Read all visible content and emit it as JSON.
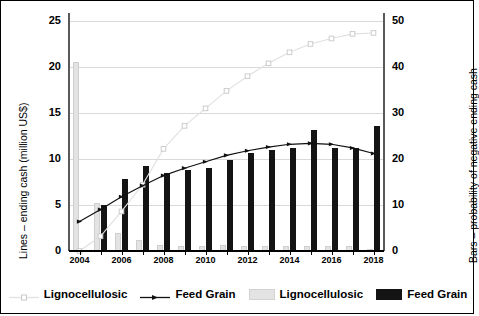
{
  "axes": {
    "left_title": "Lines – ending cash (million US$)",
    "right_title": "Bars – probability of negative ending cash",
    "left_ticks": [
      "0",
      "5",
      "10",
      "15",
      "20",
      "25"
    ],
    "right_ticks": [
      "0",
      "10",
      "20",
      "30",
      "40",
      "50"
    ],
    "x_ticks": [
      "2004",
      "2006",
      "2008",
      "2010",
      "2012",
      "2014",
      "2016",
      "2018"
    ]
  },
  "legend": {
    "items": [
      {
        "label": "Lignocellulosic",
        "kind": "line",
        "color": "#e0e0e0"
      },
      {
        "label": "Feed Grain",
        "kind": "line",
        "color": "#111111"
      },
      {
        "label": "Lignocellulosic",
        "kind": "bar",
        "color": "#e3e3e3"
      },
      {
        "label": "Feed Grain",
        "kind": "bar",
        "color": "#141414"
      }
    ]
  },
  "colors": {
    "lignocellulosic": "#e3e3e3",
    "feed_grain": "#141414",
    "grid": "#d9d9d9",
    "axis": "#595959"
  },
  "chart_data": {
    "type": "bar",
    "title": "",
    "xlabel": "",
    "ylabel": "Lines – ending cash (million US$)",
    "y2label": "Bars – probability of negative ending cash",
    "ylim": [
      0,
      25
    ],
    "y2lim": [
      0,
      50
    ],
    "grid": true,
    "legend_position": "bottom",
    "categories": [
      2004,
      2005,
      2006,
      2007,
      2008,
      2009,
      2010,
      2011,
      2012,
      2013,
      2014,
      2015,
      2016,
      2017,
      2018
    ],
    "series": [
      {
        "name": "Lignocellulosic",
        "kind": "line",
        "axis": "left",
        "marker": "square",
        "color": "#e0e0e0",
        "values": [
          0.0,
          1.6,
          4.3,
          7.2,
          11.1,
          13.6,
          15.5,
          17.4,
          19.0,
          20.4,
          21.6,
          22.5,
          23.1,
          23.6,
          23.7
        ]
      },
      {
        "name": "Feed Grain",
        "kind": "line",
        "axis": "left",
        "marker": "triangle",
        "color": "#111111",
        "values": [
          3.2,
          4.5,
          5.9,
          7.1,
          8.2,
          9.0,
          9.7,
          10.4,
          10.9,
          11.3,
          11.6,
          11.7,
          11.6,
          11.2,
          10.6
        ]
      },
      {
        "name": "Lignocellulosic",
        "kind": "bar",
        "axis": "right",
        "color": "#e3e3e3",
        "values": [
          41.0,
          10.4,
          4.0,
          2.4,
          1.2,
          1.0,
          1.0,
          1.2,
          1.1,
          1.1,
          1.0,
          1.0,
          1.0,
          1.0,
          0.5
        ]
      },
      {
        "name": "Feed Grain",
        "kind": "bar",
        "axis": "right",
        "color": "#141414",
        "values": [
          0.0,
          10.0,
          15.6,
          18.4,
          17.0,
          17.6,
          18.0,
          19.8,
          21.2,
          22.0,
          22.4,
          26.2,
          22.4,
          22.4,
          27.2
        ]
      }
    ]
  }
}
